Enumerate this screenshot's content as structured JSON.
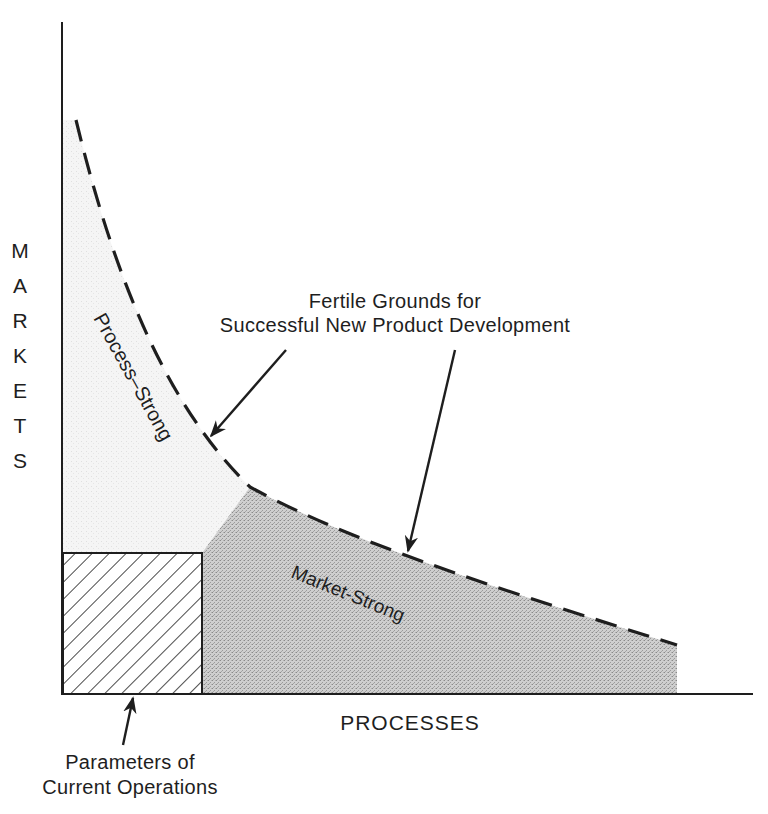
{
  "axes": {
    "y_label": "MARKETS",
    "y_letters": [
      "M",
      "A",
      "R",
      "K",
      "E",
      "T",
      "S"
    ],
    "x_label": "PROCESSES"
  },
  "regions": {
    "process_strong": "Process–Strong",
    "market_strong": "Market-Strong",
    "current_operations": "Parameters of Current Operations"
  },
  "annotations": {
    "fertile_line1": "Fertile Grounds for",
    "fertile_line2": "Successful New Product Development",
    "current_line1": "Parameters of",
    "current_line2": "Current Operations"
  },
  "colors": {
    "ink": "#1e1e1e",
    "process_fill": "#f1f1f1",
    "market_fill": "#c4c4c4",
    "background": "#ffffff"
  }
}
